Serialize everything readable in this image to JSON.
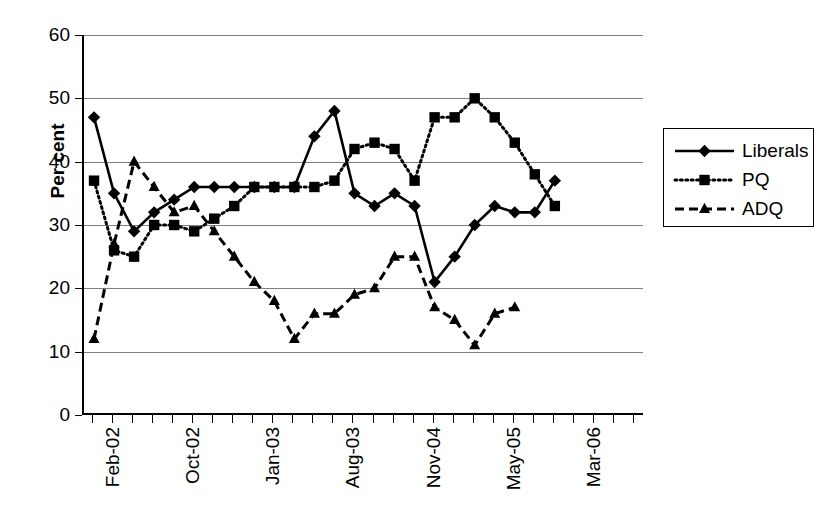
{
  "chart_data": {
    "type": "line",
    "title": "",
    "xlabel": "",
    "ylabel": "Per cent",
    "ylim": [
      0,
      60
    ],
    "yticks": [
      0,
      10,
      20,
      30,
      40,
      50,
      60
    ],
    "grid": true,
    "legend_position": "right",
    "x_tick_labels": [
      "Feb-02",
      "Oct-02",
      "Jan-03",
      "Aug-03",
      "Nov-04",
      "May-05",
      "Mar-06"
    ],
    "x_tick_indices": [
      0,
      4,
      8,
      12,
      16,
      20,
      24
    ],
    "n_points": 29,
    "series": [
      {
        "name": "Liberals",
        "marker": "diamond",
        "line_style": "solid",
        "color": "#000000",
        "values": [
          47,
          35,
          29,
          32,
          34,
          36,
          36,
          36,
          36,
          36,
          36,
          44,
          48,
          35,
          33,
          35,
          33,
          21,
          25,
          30,
          33,
          32,
          32,
          37
        ]
      },
      {
        "name": "PQ",
        "marker": "square",
        "line_style": "dotted",
        "color": "#000000",
        "values": [
          37,
          26,
          25,
          30,
          30,
          29,
          31,
          33,
          36,
          36,
          36,
          36,
          37,
          42,
          43,
          42,
          37,
          47,
          47,
          50,
          47,
          43,
          38,
          33
        ]
      },
      {
        "name": "ADQ",
        "marker": "triangle",
        "line_style": "dashed",
        "color": "#000000",
        "values": [
          12,
          27,
          40,
          36,
          32,
          33,
          29,
          25,
          21,
          18,
          12,
          16,
          16,
          19,
          20,
          25,
          25,
          17,
          15,
          11,
          16,
          17
        ]
      }
    ],
    "series_x": {
      "Liberals": [
        0,
        1,
        2,
        3,
        4,
        5,
        6,
        7,
        8,
        9,
        10,
        11,
        12,
        13,
        14,
        15,
        16,
        17,
        18,
        19,
        20,
        21,
        22,
        23
      ],
      "PQ": [
        0,
        1,
        2,
        3,
        4,
        5,
        6,
        7,
        8,
        9,
        10,
        11,
        12,
        13,
        14,
        15,
        16,
        17,
        18,
        19,
        20,
        21,
        22,
        23
      ],
      "ADQ": [
        0,
        1,
        2,
        3,
        4,
        5,
        6,
        7,
        8,
        9,
        10,
        11,
        12,
        13,
        14,
        15,
        16,
        17,
        18,
        19,
        20,
        21
      ]
    }
  },
  "legend": {
    "items": [
      {
        "label": "Liberals",
        "marker": "diamond",
        "style": "solid"
      },
      {
        "label": "PQ",
        "marker": "square",
        "style": "dotted"
      },
      {
        "label": "ADQ",
        "marker": "triangle",
        "style": "dashed"
      }
    ]
  }
}
